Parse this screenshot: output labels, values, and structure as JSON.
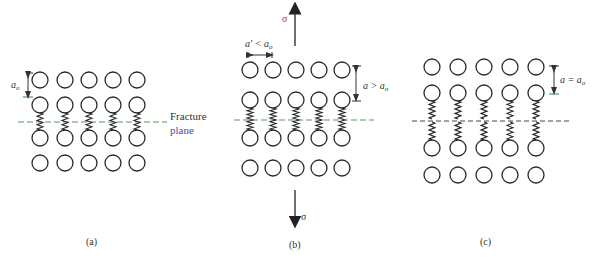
{
  "colors": {
    "ink": "#2a2a2a",
    "fracture_line_green": "#5a9a5a",
    "fracture_line_dark": "#444444",
    "sigma_red": "#b03030",
    "plane_blue": "#4a4a9a"
  },
  "panels": [
    {
      "id": "a",
      "caption": "(a)",
      "columns_x": [
        40,
        65,
        89,
        113,
        137
      ],
      "rows_y": [
        80,
        105,
        138,
        163
      ],
      "radius": 8,
      "fracture_y": 122,
      "springs": "bridging rows 2-3 across plane",
      "dimension_label": "a",
      "dimension_sub": "o",
      "fracture_label_line1": "Fracture",
      "fracture_label_line2": "plane"
    },
    {
      "id": "b",
      "caption": "(b)",
      "columns_x": [
        250,
        273,
        296,
        319,
        342
      ],
      "rows_y": [
        70,
        100,
        138,
        168
      ],
      "radius": 8,
      "fracture_y": 120,
      "springs": "stretched bridging rows 2-3",
      "spacing_label": "a′ < a",
      "spacing_sub": "o",
      "dimension_label": "a > a",
      "dimension_sub": "o",
      "stress_symbol_top": "σ",
      "stress_symbol_bottom": "σ"
    },
    {
      "id": "c",
      "caption": "(c)",
      "columns_x": [
        432,
        458,
        484,
        510,
        536
      ],
      "rows_y": [
        67,
        93,
        148,
        175
      ],
      "radius": 8,
      "fracture_y": 121,
      "springs": "broken bonds; spring halves on each side",
      "dimension_label": "a = a",
      "dimension_sub": "o"
    }
  ]
}
